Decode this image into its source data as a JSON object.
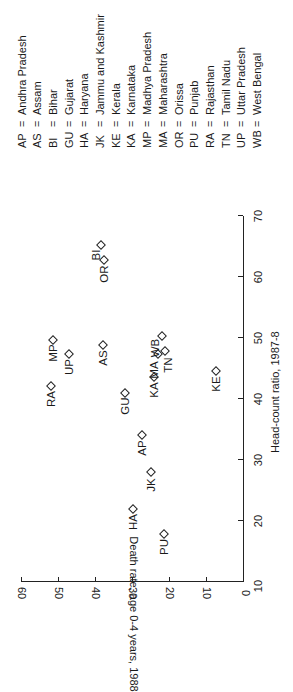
{
  "chart_data": {
    "type": "scatter",
    "orientation_note_visible": "figure rotated 90 degrees counter-clockwise",
    "xlabel": "Head-count ratio, 1987-8",
    "ylabel": "Death rate, age 0-4 years, 1988",
    "xlim": [
      10,
      70
    ],
    "ylim": [
      0,
      60
    ],
    "xticks": [
      10,
      20,
      30,
      40,
      50,
      60,
      70
    ],
    "yticks": [
      0,
      10,
      20,
      30,
      40,
      50,
      60
    ],
    "grid": false,
    "marker": "diamond",
    "points": [
      {
        "label": "AP",
        "x": 34.0,
        "y": 27.2
      },
      {
        "label": "AS",
        "x": 48.8,
        "y": 37.8
      },
      {
        "label": "BI",
        "x": 65.2,
        "y": 38.4
      },
      {
        "label": "GU",
        "x": 41.0,
        "y": 31.9
      },
      {
        "label": "HA",
        "x": 22.0,
        "y": 29.6
      },
      {
        "label": "JK",
        "x": 28.0,
        "y": 24.9
      },
      {
        "label": "KE",
        "x": 44.5,
        "y": 7.3
      },
      {
        "label": "KA",
        "x": 43.6,
        "y": 24.1
      },
      {
        "label": "MP",
        "x": 49.7,
        "y": 51.4
      },
      {
        "label": "MA",
        "x": 47.3,
        "y": 22.9
      },
      {
        "label": "OR",
        "x": 62.7,
        "y": 37.6
      },
      {
        "label": "PU",
        "x": 17.8,
        "y": 21.4
      },
      {
        "label": "RA",
        "x": 42.1,
        "y": 51.9
      },
      {
        "label": "TN",
        "x": 47.8,
        "y": 21.1
      },
      {
        "label": "UP",
        "x": 47.3,
        "y": 46.9
      },
      {
        "label": "WB",
        "x": 50.3,
        "y": 22.0
      }
    ],
    "legend": [
      {
        "abbr": "AP",
        "name": "Andhra Pradesh"
      },
      {
        "abbr": "AS",
        "name": "Assam"
      },
      {
        "abbr": "BI",
        "name": "Bihar"
      },
      {
        "abbr": "GU",
        "name": "Gujarat"
      },
      {
        "abbr": "HA",
        "name": "Haryana"
      },
      {
        "abbr": "JK",
        "name": "Jammu and Kashmir"
      },
      {
        "abbr": "KE",
        "name": "Kerala"
      },
      {
        "abbr": "KA",
        "name": "Karnataka"
      },
      {
        "abbr": "MP",
        "name": "Madhya Pradesh"
      },
      {
        "abbr": "MA",
        "name": "Maharashtra"
      },
      {
        "abbr": "OR",
        "name": "Orissa"
      },
      {
        "abbr": "PU",
        "name": "Punjab"
      },
      {
        "abbr": "RA",
        "name": "Rajasthan"
      },
      {
        "abbr": "TN",
        "name": "Tamil Nadu"
      },
      {
        "abbr": "UP",
        "name": "Uttar Pradesh"
      },
      {
        "abbr": "WB",
        "name": "West Bengal"
      }
    ],
    "legend_separator": "="
  }
}
